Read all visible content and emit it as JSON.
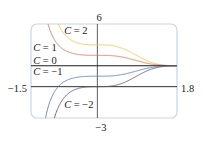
{
  "chart_data": {
    "type": "line",
    "title": "",
    "xlabel": "",
    "ylabel": "",
    "xlim": [
      -1.5,
      1.8
    ],
    "ylim": [
      -3,
      6
    ],
    "grid": false,
    "legend_position": "inline",
    "axis_labels": {
      "x_min": "−1.5",
      "x_max": "1.8",
      "y_max": "6",
      "y_min": "−3"
    },
    "function": "y = 2 + C e^{-x^3}",
    "series": [
      {
        "name": "C = 2",
        "C": 2,
        "color": "#f2c94c",
        "label_pos": [
          -0.75,
          5.0
        ]
      },
      {
        "name": "C = 1",
        "C": 1,
        "color": "#e07a5f",
        "label_pos": [
          -1.45,
          3.45
        ]
      },
      {
        "name": "C = 0",
        "C": 0,
        "color": "#1a1a1a",
        "label_pos": [
          -1.45,
          2.2
        ]
      },
      {
        "name": "C = −1",
        "C": -1,
        "color": "#5b7fc7",
        "label_pos": [
          -1.45,
          1.1
        ]
      },
      {
        "name": "C = −2",
        "C": -2,
        "color": "#6b5a7a",
        "label_pos": [
          -0.75,
          -2.05
        ]
      }
    ],
    "sample_points": {
      "x": [
        -1.5,
        -1.0,
        -0.5,
        0,
        0.5,
        1.0,
        1.5,
        1.8
      ],
      "C=2": [
        null,
        7.44,
        4.27,
        4.0,
        3.77,
        2.74,
        2.07,
        2.01
      ],
      "C=1": [
        null,
        4.72,
        3.13,
        3.0,
        2.88,
        2.37,
        2.03,
        2.0
      ],
      "C=0": [
        2,
        2,
        2,
        2,
        2,
        2,
        2,
        2
      ],
      "C=-1": [
        -27.3,
        -0.72,
        0.87,
        1.0,
        1.12,
        1.63,
        1.97,
        2.0
      ],
      "C=-2": [
        -56.6,
        -3.44,
        -0.27,
        0.0,
        0.24,
        1.26,
        1.93,
        1.99
      ]
    }
  },
  "frame": {
    "stroke": "#c9d5e6",
    "axis_color": "#1a1a1a"
  }
}
